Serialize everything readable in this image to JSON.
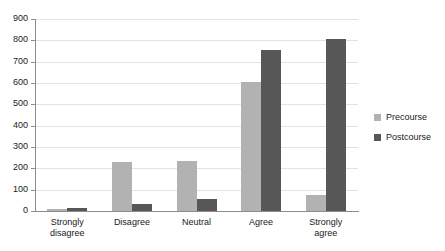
{
  "chart_data": {
    "type": "bar",
    "title": "",
    "subtitle": "",
    "xlabel": "",
    "ylabel": "",
    "categories": [
      "Strongly disagree",
      "Disagree",
      "Neutral",
      "Agree",
      "Strongly agree"
    ],
    "category_lines": [
      [
        "Strongly",
        "disagree"
      ],
      [
        "Disagree",
        ""
      ],
      [
        "Neutral",
        ""
      ],
      [
        "Agree",
        ""
      ],
      [
        "Strongly",
        "agree"
      ]
    ],
    "series": [
      {
        "name": "Precourse",
        "color": "#b2b2b2",
        "values": [
          8,
          228,
          233,
          605,
          75
        ]
      },
      {
        "name": "Postcourse",
        "color": "#575757",
        "values": [
          12,
          33,
          55,
          757,
          808
        ]
      }
    ],
    "ylim": [
      0,
      900
    ],
    "ytick_values": [
      0,
      100,
      200,
      300,
      400,
      500,
      600,
      700,
      800,
      900
    ],
    "ytick_labels": [
      "0",
      "100",
      "200",
      "300",
      "400",
      "500",
      "600",
      "700",
      "800",
      "900"
    ],
    "grid": true,
    "grid_color": "#e3e3e3",
    "legend": {
      "position": "right",
      "entries": [
        {
          "label": "Precourse",
          "color": "#b2b2b2"
        },
        {
          "label": "Postcourse",
          "color": "#575757"
        }
      ]
    },
    "axis_color": "#8c8c8c",
    "background": "#ffffff"
  }
}
